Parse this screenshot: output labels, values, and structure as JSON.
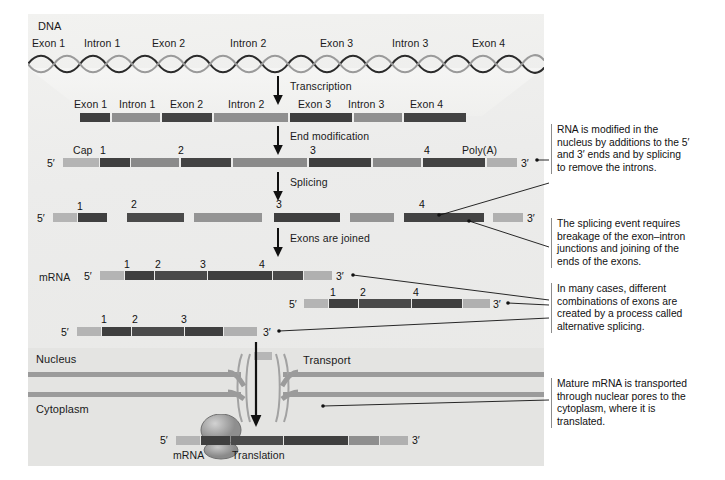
{
  "figure": {
    "title": "DNA",
    "dna_feature_labels": [
      "Exon 1",
      "Intron 1",
      "Exon 2",
      "Intron 2",
      "Exon 3",
      "Intron 3",
      "Exon 4"
    ],
    "process_arrows": [
      {
        "label": "Transcription"
      },
      {
        "label": "End modification"
      },
      {
        "label": "Splicing"
      },
      {
        "label": "Exons are joined"
      },
      {
        "label": "Transport"
      },
      {
        "label": "Translation"
      }
    ],
    "compartments": {
      "nucleus": "Nucleus",
      "cytoplasm": "Cytoplasm"
    },
    "mrna_label": "mRNA",
    "mrna_label_bottom": "mRNA",
    "five_prime": "5′",
    "three_prime": "3′",
    "cap_label": "Cap",
    "polya_label": "Poly(A)",
    "exon_numbers": [
      "1",
      "2",
      "3",
      "4"
    ]
  },
  "rows": {
    "dna_transcript": {
      "feature_labels": [
        "Exon 1",
        "Intron 1",
        "Exon 2",
        "Intron 2",
        "Exon 3",
        "Intron 3",
        "Exon 4"
      ]
    },
    "primary_transcript": {
      "numbers": [
        "1",
        "2",
        "3",
        "4"
      ],
      "cap": "Cap",
      "polya": "Poly(A)"
    },
    "spliced": {
      "numbers": [
        "1",
        "2",
        "3",
        "4"
      ]
    },
    "mature_mrna": {
      "label": "mRNA",
      "numbers": [
        "1",
        "2",
        "3",
        "4"
      ]
    },
    "alt_variant_a": {
      "numbers": [
        "1",
        "2",
        "4"
      ]
    },
    "alt_variant_b": {
      "numbers": [
        "1",
        "2",
        "3"
      ]
    },
    "translated_mrna": {
      "label": "mRNA"
    }
  },
  "notes": [
    {
      "id": "note-rna-modification",
      "text": "RNA is modified in the\nnucleus by additions to the 5′\nand 3′ ends and by splicing\nto remove the introns."
    },
    {
      "id": "note-splicing-event",
      "text": "The splicing event requires\nbreakage of the exon–intron\njunctions and joining of the\nends of the exons."
    },
    {
      "id": "note-alternative-splicing",
      "text": "In many cases, different\ncombinations of exons are\ncreated by a process called\nalternative splicing."
    },
    {
      "id": "note-transport",
      "text": "Mature mRNA is transported\nthrough nuclear pores to the\ncytoplasm, where it is\ntranslated."
    }
  ],
  "colors": {
    "exon": "#4a4a4a",
    "exon_dark": "#3d3d3d",
    "intron": "#8f8f8f",
    "cap": "#b3b3b3",
    "polya": "#b0b0b0",
    "membrane": "#9b9b9b",
    "panel_bg": "#ececea",
    "text": "#111111"
  }
}
